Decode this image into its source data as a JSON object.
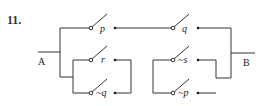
{
  "problem_number": "11.",
  "terminals": {
    "left": "A",
    "right": "B"
  },
  "switches": {
    "p": {
      "label": "p"
    },
    "q": {
      "label": "q"
    },
    "r": {
      "label": "r"
    },
    "not_q": {
      "label": "~q"
    },
    "not_s": {
      "label": "~s"
    },
    "not_p": {
      "label": "~p"
    }
  },
  "colors": {
    "wire": "#333333",
    "text": "#222222",
    "background": "#ffffff"
  }
}
